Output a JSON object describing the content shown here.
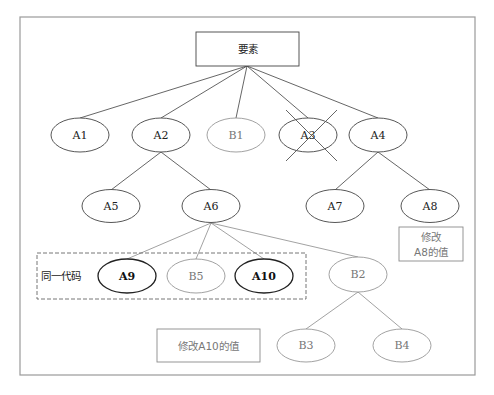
{
  "diagram": {
    "root": {
      "label": "要素"
    },
    "nodes": {
      "A1": "A1",
      "A2": "A2",
      "B1": "B1",
      "A3": "A3",
      "A4": "A4",
      "A5": "A5",
      "A6": "A6",
      "A7": "A7",
      "A8": "A8",
      "A9": "A9",
      "B5": "B5",
      "A10": "A10",
      "B2": "B2",
      "B3": "B3",
      "B4": "B4"
    },
    "group": {
      "label": "同一代码",
      "members": [
        "A9",
        "B5",
        "A10"
      ]
    },
    "notes": {
      "a8_line1": "修改",
      "a8_line2": "A8的值",
      "a10": "修改A10的值"
    },
    "deleted_node": "A3",
    "edges": [
      [
        "要素",
        "A1"
      ],
      [
        "要素",
        "A2"
      ],
      [
        "要素",
        "B1"
      ],
      [
        "要素",
        "A3"
      ],
      [
        "要素",
        "A4"
      ],
      [
        "A2",
        "A5"
      ],
      [
        "A2",
        "A6"
      ],
      [
        "A4",
        "A7"
      ],
      [
        "A4",
        "A8"
      ],
      [
        "A6",
        "A9"
      ],
      [
        "A6",
        "B5"
      ],
      [
        "A6",
        "A10"
      ],
      [
        "A6",
        "B2"
      ],
      [
        "B2",
        "B3"
      ],
      [
        "B2",
        "B4"
      ]
    ],
    "colors": {
      "original_node": "#444444",
      "new_node": "#8a8a8a",
      "modified_node": "#222222"
    }
  }
}
